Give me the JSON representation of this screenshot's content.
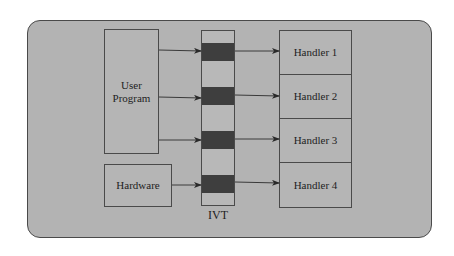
{
  "diagram": {
    "sources": [
      {
        "id": "user-program",
        "label_lines": [
          "User",
          "Program"
        ]
      },
      {
        "id": "hardware",
        "label": "Hardware"
      }
    ],
    "ivt": {
      "label": "IVT",
      "entries": 4
    },
    "handlers": [
      {
        "label": "Handler 1"
      },
      {
        "label": "Handler 2"
      },
      {
        "label": "Handler 3"
      },
      {
        "label": "Handler 4"
      }
    ],
    "edges": [
      {
        "from": "User Program",
        "to": "IVT entry 1"
      },
      {
        "from": "User Program",
        "to": "IVT entry 2"
      },
      {
        "from": "User Program",
        "to": "IVT entry 3"
      },
      {
        "from": "Hardware",
        "to": "IVT entry 4"
      },
      {
        "from": "IVT entry 1",
        "to": "Handler 1"
      },
      {
        "from": "IVT entry 2",
        "to": "Handler 2"
      },
      {
        "from": "IVT entry 3",
        "to": "Handler 3"
      },
      {
        "from": "IVT entry 4",
        "to": "Handler 4"
      }
    ],
    "colors": {
      "panel_bg": "#b3b3b3",
      "border": "#4a4a4a",
      "ivt_slot": "#3e3e3e",
      "text": "#1e1e1e"
    }
  }
}
